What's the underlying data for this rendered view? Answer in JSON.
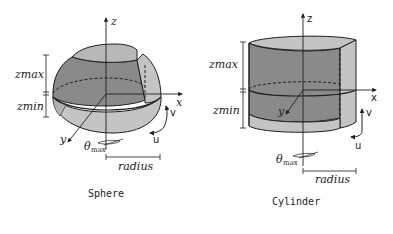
{
  "colors": {
    "dark_fill": "#8a8a8a",
    "light_fill": "#c4c4c4",
    "cap_fill": "#b8b8b8",
    "stroke": "#1f1f1f",
    "background": "#ffffff"
  },
  "panels": [
    {
      "name": "sphere",
      "caption": "Sphere",
      "labels": {
        "z_axis": "z",
        "x_axis": "x",
        "y_axis": "y",
        "zmax": "zmax",
        "zmin": "zmin",
        "theta": "θ",
        "theta_sub": "max",
        "radius": "radius",
        "u": "u",
        "v": "v"
      }
    },
    {
      "name": "cylinder",
      "caption": "Cylinder",
      "labels": {
        "z_axis": "z",
        "x_axis": "x",
        "y_axis": "y",
        "zmax": "zmax",
        "zmin": "zmin",
        "theta": "θ",
        "theta_sub": "max",
        "radius": "radius",
        "u": "u",
        "v": "v"
      }
    }
  ]
}
